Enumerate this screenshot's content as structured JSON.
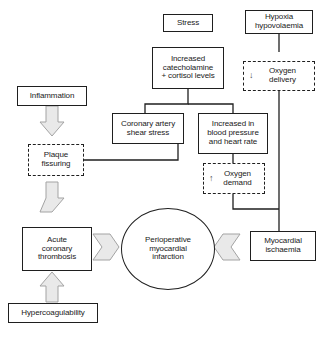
{
  "diagram": {
    "type": "flowchart",
    "colors": {
      "stroke": "#1f1f1f",
      "background": "#ffffff",
      "block_arrow_fill": "#e8e8e8",
      "block_arrow_stroke": "#9a9a9a",
      "text": "#1a1a1a"
    },
    "nodes": [
      {
        "id": "stress",
        "label": "Stress",
        "shape": "rect",
        "border": "solid"
      },
      {
        "id": "hypoxia",
        "label": "Hypoxia\nhypovolaemia",
        "shape": "rect",
        "border": "solid"
      },
      {
        "id": "catecholamine",
        "label": "Increased\ncatecholamine\n+ cortisol levels",
        "shape": "rect",
        "border": "solid"
      },
      {
        "id": "oxygen_delivery",
        "label": "Oxygen\ndelivery",
        "shape": "rect",
        "border": "dashed",
        "symbol": "↓"
      },
      {
        "id": "inflammation",
        "label": "Inflammation",
        "shape": "rect",
        "border": "solid"
      },
      {
        "id": "shear_stress",
        "label": "Coronary artery\nshear stress",
        "shape": "rect",
        "border": "solid"
      },
      {
        "id": "bp_hr",
        "label": "Increased in\nblood pressure\nand heart rate",
        "shape": "rect",
        "border": "solid"
      },
      {
        "id": "plaque",
        "label": "Plaque\nfissuring",
        "shape": "rect",
        "border": "dashed"
      },
      {
        "id": "oxygen_demand",
        "label": "Oxygen\ndemand",
        "shape": "rect",
        "border": "dashed",
        "symbol": "↑"
      },
      {
        "id": "thrombosis",
        "label": "Acute\ncoronary\nthrombosis",
        "shape": "rect",
        "border": "solid"
      },
      {
        "id": "pmi",
        "label": "Perioperative\nmyocardial\ninfarction",
        "shape": "ellipse",
        "border": "solid"
      },
      {
        "id": "ischaemia",
        "label": "Myocardial\nischaemia",
        "shape": "rect",
        "border": "solid"
      },
      {
        "id": "hypercoag",
        "label": "Hypercoagulability",
        "shape": "rect",
        "border": "solid"
      }
    ],
    "edges": [
      {
        "from": "inflammation",
        "to": "plaque",
        "style": "block-arrow",
        "direction": "down"
      },
      {
        "from": "plaque",
        "to": "thrombosis",
        "style": "block-arrow",
        "direction": "down"
      },
      {
        "from": "hypercoag",
        "to": "thrombosis",
        "style": "block-arrow",
        "direction": "up"
      },
      {
        "from": "thrombosis",
        "to": "pmi",
        "style": "block-arrow",
        "direction": "right"
      },
      {
        "from": "ischaemia",
        "to": "pmi",
        "style": "block-arrow",
        "direction": "left"
      },
      {
        "from": "hypoxia",
        "to": "oxygen_delivery",
        "style": "line",
        "direction": "down"
      },
      {
        "from": "catecholamine",
        "to": "shear_stress",
        "style": "line",
        "direction": "down"
      },
      {
        "from": "catecholamine",
        "to": "bp_hr",
        "style": "line",
        "direction": "down"
      },
      {
        "from": "shear_stress",
        "to": "plaque",
        "style": "line",
        "direction": "left"
      },
      {
        "from": "bp_hr",
        "to": "oxygen_demand",
        "style": "line",
        "direction": "down"
      },
      {
        "from": "oxygen_demand",
        "to": "ischaemia",
        "style": "line",
        "direction": "down"
      },
      {
        "from": "oxygen_delivery",
        "to": "ischaemia",
        "style": "line",
        "direction": "down"
      }
    ]
  }
}
